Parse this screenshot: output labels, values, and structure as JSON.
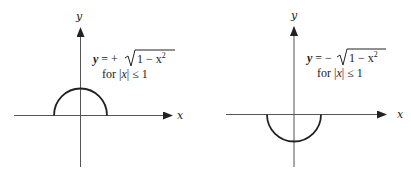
{
  "panels": [
    {
      "name": "upper-semicircle",
      "axis_x_label": "x",
      "axis_y_label": "y",
      "eq_lhs": "y",
      "eq_op": " = + ",
      "eq_rad": "1 − x",
      "eq_exp": "2",
      "cond_pre": "for |",
      "cond_var": "x",
      "cond_post": "| ≤ 1"
    },
    {
      "name": "lower-semicircle",
      "axis_x_label": "x",
      "axis_y_label": "y",
      "eq_lhs": "y",
      "eq_op": " = − ",
      "eq_rad": "1 − x",
      "eq_exp": "2",
      "cond_pre": "for |",
      "cond_var": "x",
      "cond_post": "| ≤ 1"
    }
  ],
  "colors": {
    "ink": "#222222",
    "axis": "#555555",
    "background": "#ffffff"
  }
}
